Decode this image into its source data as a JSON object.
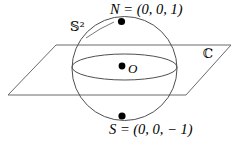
{
  "figure": {
    "caption_type": "stereographic-projection-diagram",
    "background_color": "#ffffff",
    "line_color": "#555555",
    "point_color": "#000000",
    "text_color": "#000000",
    "width": 237,
    "height": 142
  },
  "labels": {
    "north_pole": "N = (0, 0, 1)",
    "south_pole": "S = (0, 0, − 1)",
    "origin": "O",
    "sphere": "𝕊²",
    "plane": "ℂ"
  },
  "geometry": {
    "sphere": {
      "center_x": 124.5,
      "center_y": 68.5,
      "radius_x": 52.5,
      "radius_y": 52.0
    },
    "equator_ellipse": {
      "center_x": 124.5,
      "center_y": 67.0,
      "radius_x": 52.5,
      "radius_y": 13.0
    },
    "plane_parallelogram": {
      "top_left_x": 56,
      "top_left_y": 45,
      "top_right_x": 231,
      "top_right_y": 45,
      "bottom_right_x": 186,
      "bottom_right_y": 95,
      "bottom_left_x": 8,
      "bottom_left_y": 95
    },
    "points": [
      {
        "name": "north-pole-point",
        "x": 121.5,
        "y": 21.5,
        "r": 3.6
      },
      {
        "name": "origin-point",
        "x": 122.0,
        "y": 66.0,
        "r": 3.4
      },
      {
        "name": "south-pole-point",
        "x": 122.0,
        "y": 116.0,
        "r": 3.6
      }
    ]
  }
}
